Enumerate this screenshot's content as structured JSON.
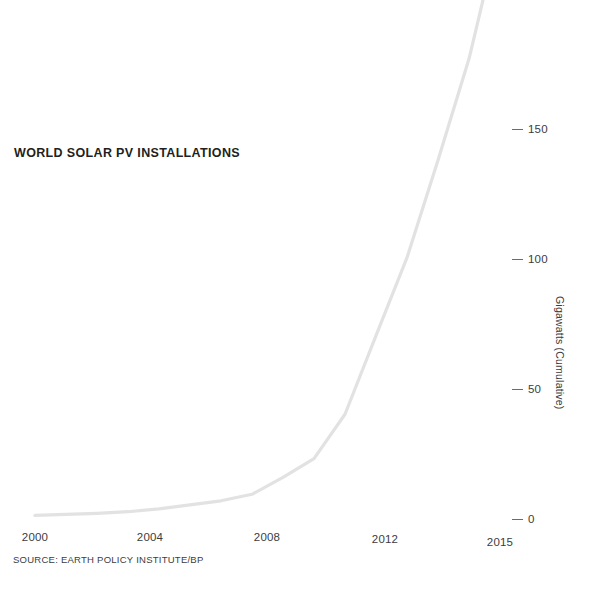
{
  "chart_data": {
    "type": "line",
    "title": "WORLD SOLAR PV INSTALLATIONS",
    "source": "SOURCE: EARTH POLICY INSTITUTE/BP",
    "xlabel": "",
    "ylabel": "Gigawatts (Cumulative)",
    "xlim": [
      2000,
      2015
    ],
    "ylim": [
      0,
      230
    ],
    "grid": false,
    "legend": "none",
    "line_color": "#e2e2e2",
    "text_color": "#231f20",
    "background": "#ffffff",
    "x_ticks": [
      "2000",
      "2004",
      "2008",
      "2012",
      "2015"
    ],
    "x_tick_values": [
      2000,
      2004,
      2008,
      2012,
      2015
    ],
    "y_ticks": [
      "0",
      "50",
      "100",
      "150"
    ],
    "y_tick_values": [
      0,
      50,
      100,
      150
    ],
    "x": [
      2000,
      2001,
      2002,
      2003,
      2004,
      2005,
      2006,
      2007,
      2008,
      2009,
      2010,
      2011,
      2012,
      2013,
      2014,
      2015
    ],
    "values": [
      1.4,
      1.8,
      2.2,
      2.8,
      3.9,
      5.4,
      7.0,
      9.5,
      16.0,
      23.2,
      40.3,
      70.5,
      100.5,
      138.0,
      177.0,
      227.0
    ],
    "series": [
      {
        "name": "World solar PV installations (cumulative)",
        "values": [
          1.4,
          1.8,
          2.2,
          2.8,
          3.9,
          5.4,
          7.0,
          9.5,
          16.0,
          23.2,
          40.3,
          70.5,
          100.5,
          138.0,
          177.0,
          227.0
        ]
      }
    ]
  },
  "figure": {
    "title": "WORLD SOLAR PV INSTALLATIONS",
    "source": "SOURCE: EARTH POLICY INSTITUTE/BP",
    "y_axis_title": "Gigawatts (Cumulative)"
  }
}
